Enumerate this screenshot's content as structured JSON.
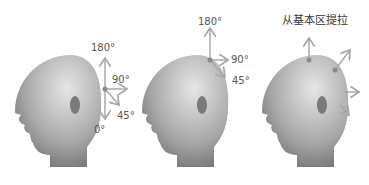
{
  "figures": [
    {
      "name": "head-left",
      "labels": {
        "top": "180°",
        "right": "90°",
        "diag": "45°",
        "bottom": "0°"
      }
    },
    {
      "name": "head-middle",
      "labels": {
        "top": "180°",
        "right": "90°",
        "diag": "45°"
      }
    },
    {
      "name": "head-right",
      "title": "从基本区提拉"
    }
  ],
  "colors": {
    "arrow": "#a8a8a8",
    "dot": "#8a8a8a",
    "head_light": "#d8d8d8",
    "head_dark": "#6e6e6e"
  }
}
